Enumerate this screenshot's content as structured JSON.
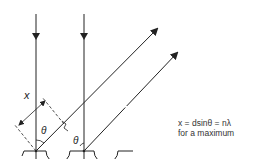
{
  "diagram": {
    "labels": {
      "x": "x",
      "theta_left": "θ",
      "theta_right": "θ",
      "d": "d"
    },
    "equation": {
      "line1": "x = dsinθ = nλ",
      "line2": "for a maximum"
    },
    "colors": {
      "stroke": "#222222",
      "background": "#ffffff"
    }
  }
}
